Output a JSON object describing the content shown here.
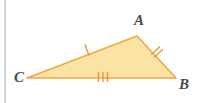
{
  "figure": {
    "name": "triangle-abc-congruence-marks",
    "background_color": "#ffffff",
    "canvas": {
      "width": 198,
      "height": 103
    },
    "left_rule": {
      "name": "page-edge-rule",
      "color": "#b9cdd4",
      "x": 5,
      "y1": 0,
      "y2": 103,
      "width": 1.6
    },
    "shape": {
      "type": "triangle",
      "fill_color": "#fbe3a6",
      "stroke_color": "#f0a843",
      "stroke_width": 1.6,
      "vertices": [
        {
          "label": "C",
          "x": 27,
          "y": 78
        },
        {
          "label": "A",
          "x": 137,
          "y": 36
        },
        {
          "label": "B",
          "x": 176,
          "y": 78
        }
      ]
    },
    "labels": [
      {
        "name": "vertex-label-a",
        "text": "A",
        "x": 139,
        "y": 25,
        "anchor": "middle"
      },
      {
        "name": "vertex-label-c",
        "text": "C",
        "x": 19,
        "y": 82,
        "anchor": "middle"
      },
      {
        "name": "vertex-label-b",
        "text": "B",
        "x": 184,
        "y": 89,
        "anchor": "middle"
      }
    ],
    "tick_marks": [
      {
        "name": "tick-mark-side-ca",
        "side": "CA",
        "count": 1,
        "color": "#e09a3a",
        "center_x": 87,
        "center_y": 50,
        "angle_deg": -21,
        "length": 11,
        "spacing": 3.5
      },
      {
        "name": "tick-mark-side-ab",
        "side": "AB",
        "count": 2,
        "color": "#e09a3a",
        "center_x": 157,
        "center_y": 52,
        "angle_deg": 47,
        "length": 11,
        "spacing": 4
      },
      {
        "name": "tick-mark-side-cb",
        "side": "CB",
        "count": 3,
        "color": "#e09a3a",
        "center_x": 103,
        "center_y": 77,
        "angle_deg": 0,
        "length": 9,
        "spacing": 4.5
      }
    ]
  }
}
